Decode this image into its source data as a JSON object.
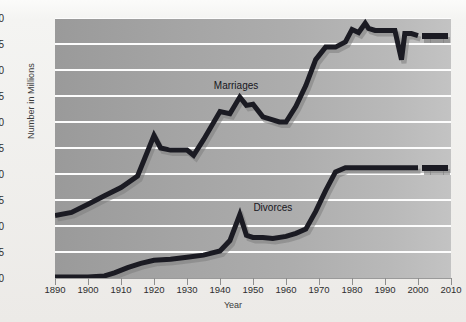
{
  "chart_data": {
    "type": "line",
    "title": "",
    "xlabel": "Year",
    "ylabel": "Number in Millions",
    "xlim": [
      1890,
      2010
    ],
    "ylim": [
      0.0,
      2.5
    ],
    "grid": true,
    "legend_position": "inline-annotations",
    "xticks": [
      1890,
      1900,
      1910,
      1920,
      1930,
      1940,
      1950,
      1960,
      1970,
      1980,
      1990,
      2000,
      2010
    ],
    "xtick_labels": [
      "1890",
      "1900",
      "1910",
      "1920",
      "1930",
      "1940",
      "1950",
      "1960",
      "1970",
      "1980",
      "1990",
      "2000",
      "2010"
    ],
    "yticks": [
      0.0,
      0.25,
      0.5,
      0.75,
      1.0,
      1.25,
      1.5,
      1.75,
      2.0,
      2.25,
      2.5
    ],
    "ytick_labels": [
      ".00",
      ".25",
      ".50",
      ".75",
      "1.0",
      "1.25",
      "1.50",
      "1.75",
      "2.0",
      "2.25",
      "2.50"
    ],
    "series": [
      {
        "name": "Marriages",
        "color": "#1b1b23",
        "shadow_color": "#7d7d7d",
        "x": [
          1890,
          1895,
          1900,
          1905,
          1910,
          1915,
          1920,
          1922,
          1925,
          1930,
          1932,
          1935,
          1940,
          1943,
          1946,
          1948,
          1950,
          1953,
          1955,
          1958,
          1960,
          1963,
          1966,
          1969,
          1972,
          1975,
          1978,
          1980,
          1982,
          1984,
          1985,
          1987,
          1990,
          1993,
          1995,
          1996,
          1998,
          2000
        ],
        "y": [
          0.6,
          0.63,
          0.71,
          0.79,
          0.87,
          0.98,
          1.37,
          1.25,
          1.23,
          1.23,
          1.18,
          1.33,
          1.6,
          1.58,
          1.74,
          1.66,
          1.67,
          1.55,
          1.53,
          1.5,
          1.5,
          1.65,
          1.85,
          2.1,
          2.22,
          2.22,
          2.27,
          2.39,
          2.36,
          2.45,
          2.4,
          2.38,
          2.38,
          2.38,
          2.1,
          2.35,
          2.35,
          2.33
        ],
        "projection_x": [
          2002,
          2004,
          2006,
          2008
        ],
        "projection_y": [
          2.33,
          2.33,
          2.33,
          2.33
        ],
        "projection_style": "dotted-squares"
      },
      {
        "name": "Divorces",
        "color": "#1b1b23",
        "shadow_color": "#7d7d7d",
        "x": [
          1890,
          1895,
          1900,
          1905,
          1908,
          1912,
          1916,
          1920,
          1925,
          1930,
          1935,
          1940,
          1943,
          1946,
          1948,
          1950,
          1953,
          1956,
          1960,
          1963,
          1966,
          1969,
          1972,
          1975,
          1978,
          1980,
          1983,
          1986,
          1990,
          1995,
          1998,
          2000
        ],
        "y": [
          0.01,
          0.01,
          0.01,
          0.02,
          0.05,
          0.1,
          0.14,
          0.17,
          0.18,
          0.2,
          0.22,
          0.26,
          0.36,
          0.61,
          0.41,
          0.39,
          0.39,
          0.38,
          0.4,
          0.43,
          0.47,
          0.64,
          0.84,
          1.02,
          1.06,
          1.06,
          1.06,
          1.06,
          1.06,
          1.06,
          1.06,
          1.06
        ],
        "projection_x": [
          2002,
          2004,
          2006,
          2008
        ],
        "projection_y": [
          1.06,
          1.06,
          1.06,
          1.06
        ],
        "projection_style": "dotted-squares"
      }
    ],
    "annotations": [
      {
        "text": "Marriages",
        "x": 1946,
        "y": 1.84
      },
      {
        "text": "Divorces",
        "x": 1958,
        "y": 0.66
      }
    ]
  },
  "colors": {
    "plot_bg_left": "#9a9a9a",
    "plot_bg_right": "#c3c3c3",
    "gridline": "#fdfdfd",
    "line": "#1b1b23",
    "shadow": "#7d7d7d",
    "page_bg": "#f2f2f0",
    "text": "#2e2e2e"
  }
}
